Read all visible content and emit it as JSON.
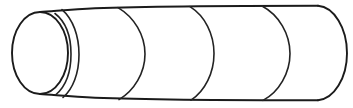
{
  "figure": {
    "title": "Cylinder line drawing",
    "kind": "line-art-diagram",
    "background_color": "#ffffff",
    "stroke_color": "#1b1b1b",
    "canvas": {
      "width": 353,
      "height": 108
    },
    "geometry": {
      "top_edge_y": 6,
      "bottom_edge_y": 100,
      "left_cap": {
        "center_x": 40,
        "center_y": 53,
        "radius_x": 28,
        "radius_y": 41,
        "label": "front elliptical face"
      },
      "right_cap": {
        "apex_x": 347,
        "center_y": 53,
        "start_x": 318,
        "label": "rounded far end"
      },
      "seam_arcs": [
        {
          "top_x": 62,
          "mid_x": 78,
          "bottom_x": 62,
          "label": "seam-1"
        },
        {
          "top_x": 118,
          "mid_x": 145,
          "bottom_x": 118,
          "label": "seam-2"
        },
        {
          "top_x": 190,
          "mid_x": 213,
          "bottom_x": 190,
          "label": "seam-3"
        },
        {
          "top_x": 262,
          "mid_x": 290,
          "bottom_x": 262,
          "label": "seam-4"
        }
      ],
      "cap_overlap_arc": {
        "top_x": 55,
        "mid_x": 70,
        "bottom_x": 55,
        "label": "cap-edge-offset"
      }
    }
  }
}
